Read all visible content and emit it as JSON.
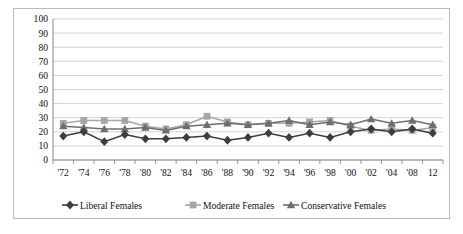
{
  "chart_data": {
    "type": "line",
    "title": "",
    "subtitle": "",
    "xlabel": "",
    "ylabel": "",
    "ylim": [
      0,
      100
    ],
    "yticks": [
      0,
      10,
      20,
      30,
      40,
      50,
      60,
      70,
      80,
      90,
      100
    ],
    "grid": true,
    "legend_position": "bottom",
    "categories": [
      "'72",
      "'74",
      "'76",
      "'78",
      "'80",
      "'82",
      "'84",
      "'86",
      "'88",
      "'90",
      "'92",
      "'94",
      "'96",
      "'98",
      "'00",
      "'02",
      "'04",
      "'08",
      "12"
    ],
    "series": [
      {
        "name": "Liberal Females",
        "marker": "diamond",
        "color": "#3d3d3d",
        "values": [
          17,
          20,
          13,
          18,
          15,
          15,
          16,
          17,
          14,
          16,
          19,
          16,
          19,
          16,
          20,
          22,
          20,
          22,
          19
        ]
      },
      {
        "name": "Moderate Females",
        "marker": "square",
        "color": "#a6a6a6",
        "values": [
          26,
          28,
          28,
          28,
          24,
          22,
          25,
          31,
          27,
          25,
          26,
          26,
          27,
          28,
          24,
          21,
          22,
          21,
          23
        ]
      },
      {
        "name": "Conservative Females",
        "marker": "triangle",
        "color": "#6e6e6e",
        "values": [
          24,
          23,
          22,
          22,
          23,
          21,
          24,
          25,
          26,
          25,
          26,
          28,
          25,
          27,
          25,
          29,
          26,
          28,
          25
        ]
      }
    ]
  },
  "legend": {
    "items": [
      {
        "label": "Liberal Females",
        "marker": "diamond-marker-icon"
      },
      {
        "label": "Moderate Females",
        "marker": "square-marker-icon"
      },
      {
        "label": "Conservative Females",
        "marker": "triangle-marker-icon"
      }
    ]
  },
  "colors": {
    "liberal": "#3d3d3d",
    "moderate": "#a6a6a6",
    "conservative": "#6e6e6e",
    "grid": "#c8c8c8",
    "axis": "#8a8a8a",
    "border": "#b9b9b9"
  }
}
